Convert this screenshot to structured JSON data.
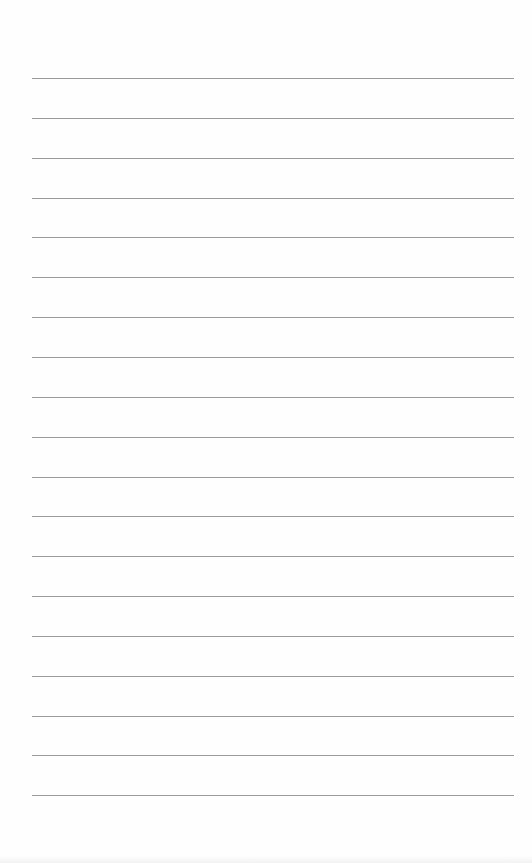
{
  "page": {
    "type": "lined-notepad",
    "background_color": "#fefefe",
    "rule_color": "#9a9a9a",
    "rule_count": 19,
    "lines": [
      "",
      "",
      "",
      "",
      "",
      "",
      "",
      "",
      "",
      "",
      "",
      "",
      "",
      "",
      "",
      "",
      "",
      "",
      ""
    ]
  }
}
